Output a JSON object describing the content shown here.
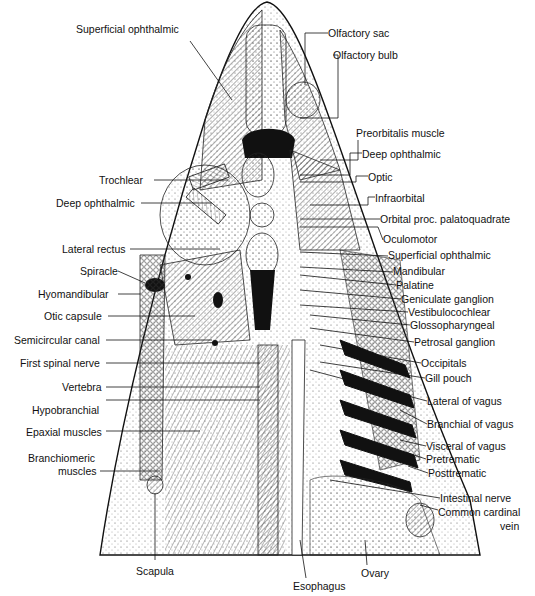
{
  "figure": {
    "left_labels": [
      {
        "id": "superficial-ophthalmic-top",
        "text": "Superficial ophthalmic",
        "x": 76,
        "y": 29
      },
      {
        "id": "trochlear",
        "text": "Trochlear",
        "x": 99,
        "y": 174
      },
      {
        "id": "deep-ophthalmic-left",
        "text": "Deep ophthalmic",
        "x": 56,
        "y": 197
      },
      {
        "id": "lateral-rectus",
        "text": "Lateral rectus",
        "x": 62,
        "y": 244
      },
      {
        "id": "spiracle",
        "text": "Spiracle",
        "x": 80,
        "y": 265
      },
      {
        "id": "hyomandibular",
        "text": "Hyomandibular",
        "x": 38,
        "y": 288
      },
      {
        "id": "otic-capsule",
        "text": "Otic capsule",
        "x": 44,
        "y": 310
      },
      {
        "id": "semicircular-canal",
        "text": "Semicircular canal",
        "x": 14,
        "y": 334
      },
      {
        "id": "first-spinal-nerve",
        "text": "First spinal nerve",
        "x": 20,
        "y": 357
      },
      {
        "id": "vertebra",
        "text": "Vertebra",
        "x": 62,
        "y": 382
      },
      {
        "id": "hypobranchial",
        "text": "Hypobranchial",
        "x": 32,
        "y": 405
      },
      {
        "id": "epaxial-muscles",
        "text": "Epaxial muscles",
        "x": 26,
        "y": 426
      },
      {
        "id": "branchiomeric-muscles-1",
        "text": "Branchiomeric",
        "x": 28,
        "y": 452
      },
      {
        "id": "branchiomeric-muscles-2",
        "text": "muscles",
        "x": 58,
        "y": 465
      },
      {
        "id": "scapula",
        "text": "Scapula",
        "x": 136,
        "y": 565
      }
    ],
    "right_labels": [
      {
        "id": "olfactory-sac",
        "text": "Olfactory sac",
        "x": 328,
        "y": 27
      },
      {
        "id": "olfactory-bulb",
        "text": "Olfactory bulb",
        "x": 333,
        "y": 49
      },
      {
        "id": "preorbitalis-muscle",
        "text": "Preorbitalis muscle",
        "x": 356,
        "y": 127
      },
      {
        "id": "deep-ophthalmic-right",
        "text": "Deep ophthalmic",
        "x": 362,
        "y": 148
      },
      {
        "id": "optic",
        "text": "Optic",
        "x": 368,
        "y": 171
      },
      {
        "id": "infraorbital",
        "text": "Infraorbital",
        "x": 375,
        "y": 192
      },
      {
        "id": "orbital-proc",
        "text": "Orbital proc. palatoquadrate",
        "x": 380,
        "y": 213
      },
      {
        "id": "oculomotor",
        "text": "Oculomotor",
        "x": 383,
        "y": 234
      },
      {
        "id": "superficial-ophthalmic-right",
        "text": "Superficial ophthalmic",
        "x": 388,
        "y": 250
      },
      {
        "id": "mandibular",
        "text": "Mandibular",
        "x": 393,
        "y": 266
      },
      {
        "id": "palatine",
        "text": "Palatine",
        "x": 396,
        "y": 279
      },
      {
        "id": "geniculate-ganglion",
        "text": "Geniculate ganglion",
        "x": 401,
        "y": 293
      },
      {
        "id": "vestibulocochlear",
        "text": "Vestibulocochlear",
        "x": 408,
        "y": 306
      },
      {
        "id": "glossopharyngeal",
        "text": "Glossopharyngeal",
        "x": 410,
        "y": 319
      },
      {
        "id": "petrosal-ganglion",
        "text": "Petrosal ganglion",
        "x": 414,
        "y": 336
      },
      {
        "id": "occipitals",
        "text": "Occipitals",
        "x": 421,
        "y": 357
      },
      {
        "id": "gill-pouch",
        "text": "Gill pouch",
        "x": 425,
        "y": 372
      },
      {
        "id": "lateral-of-vagus",
        "text": "Lateral of vagus",
        "x": 427,
        "y": 395
      },
      {
        "id": "branchial-of-vagus",
        "text": "Branchial of vagus",
        "x": 427,
        "y": 418
      },
      {
        "id": "visceral-of-vagus",
        "text": "Visceral of vagus",
        "x": 426,
        "y": 440
      },
      {
        "id": "pretrematic",
        "text": "Pretrematic",
        "x": 426,
        "y": 453
      },
      {
        "id": "posttrematic",
        "text": "Posttrematic",
        "x": 428,
        "y": 467
      },
      {
        "id": "intestinal-nerve",
        "text": "Intestinal nerve",
        "x": 440,
        "y": 492
      },
      {
        "id": "common-cardinal-vein-1",
        "text": "Common cardinal",
        "x": 438,
        "y": 506
      },
      {
        "id": "common-cardinal-vein-2",
        "text": "vein",
        "x": 500,
        "y": 520
      },
      {
        "id": "ovary",
        "text": "Ovary",
        "x": 361,
        "y": 567
      },
      {
        "id": "esophagus",
        "text": "Esophagus",
        "x": 293,
        "y": 580
      }
    ]
  }
}
